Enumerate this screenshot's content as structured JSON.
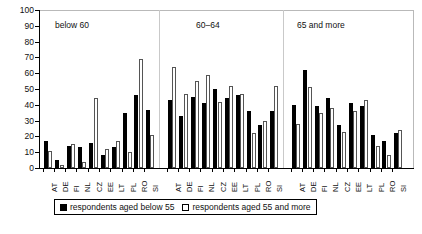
{
  "chart_data": {
    "type": "bar",
    "title": "",
    "xlabel": "",
    "ylabel": "",
    "ylim": [
      0,
      100
    ],
    "ytick_values": [
      0,
      10,
      20,
      30,
      40,
      50,
      60,
      70,
      80,
      90,
      100
    ],
    "grid": false,
    "legend_position": "bottom",
    "panels": [
      {
        "label": "below 60",
        "categories": [
          "AT",
          "DE",
          "FI",
          "NL",
          "CZ",
          "EE",
          "LT",
          "PL",
          "RO",
          "SI"
        ],
        "series": [
          {
            "name": "respondents aged below 55",
            "values": [
              17,
              5,
              14,
              13,
              16,
              8,
              13,
              35,
              46,
              37
            ]
          },
          {
            "name": "respondents aged 55 and more",
            "values": [
              11,
              2,
              15,
              4,
              44,
              12,
              17,
              10,
              69,
              21
            ]
          }
        ]
      },
      {
        "label": "60–64",
        "categories": [
          "AT",
          "DE",
          "FI",
          "NL",
          "CZ",
          "EE",
          "LT",
          "PL",
          "RO",
          "SI"
        ],
        "series": [
          {
            "name": "respondents aged below 55",
            "values": [
              43,
              33,
              45,
              41,
              50,
              44,
              46,
              36,
              27,
              36
            ]
          },
          {
            "name": "respondents aged 55 and more",
            "values": [
              64,
              47,
              55,
              59,
              42,
              52,
              47,
              22,
              30,
              52
            ]
          }
        ]
      },
      {
        "label": "65 and more",
        "categories": [
          "AT",
          "DE",
          "FI",
          "NL",
          "CZ",
          "EE",
          "LT",
          "PL",
          "RO",
          "SI"
        ],
        "series": [
          {
            "name": "respondents aged below 55",
            "values": [
              40,
              62,
              39,
              44,
              27,
              41,
              39,
              21,
              17,
              22
            ]
          },
          {
            "name": "respondents aged 55 and more",
            "values": [
              28,
              51,
              35,
              38,
              23,
              36,
              43,
              14,
              8,
              24
            ]
          }
        ]
      }
    ]
  },
  "legend": {
    "items": [
      {
        "swatch": "black",
        "label": "respondents aged below 55"
      },
      {
        "swatch": "white",
        "label": "respondents aged 55 and more"
      }
    ]
  }
}
